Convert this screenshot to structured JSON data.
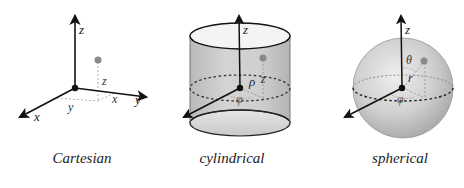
{
  "figure": {
    "panels": [
      {
        "id": "cartesian",
        "caption": "Cartesian",
        "axis_labels": {
          "x": "x",
          "y": "y",
          "z": "z"
        },
        "coordinate_labels": {
          "x": "x",
          "y": "y",
          "z": "z"
        }
      },
      {
        "id": "cylindrical",
        "caption": "cylindrical",
        "axis_labels": {
          "z": "z"
        },
        "coordinate_labels": {
          "rho": "ρ",
          "phi": "φ",
          "z": "z"
        }
      },
      {
        "id": "spherical",
        "caption": "spherical",
        "axis_labels": {
          "z": "z"
        },
        "coordinate_labels": {
          "theta": "θ",
          "r": "r",
          "phi": "φ"
        }
      }
    ],
    "colors": {
      "axis": "#111111",
      "point": "#8a8a8a",
      "dashed": "#999999",
      "surface_fill": "#c8c8c8",
      "top_fill": "#f4f4f4"
    }
  }
}
